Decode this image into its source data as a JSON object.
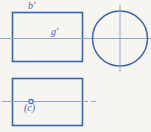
{
  "figure": {
    "kind": "orthographic-projection-drawing",
    "background_color": "#f7f5f1",
    "line_color": "#3a64a8",
    "centerline_color": "#8fa6c8",
    "labels": {
      "b_prime": "b'",
      "g_prime": "g'",
      "c_parenthesized": "(c)"
    },
    "views": {
      "front_view": {
        "shape": "rectangle",
        "x": 12,
        "y": 12,
        "width": 71,
        "height": 50
      },
      "side_view": {
        "shape": "circle",
        "center_x": 120,
        "center_y": 38,
        "radius": 28
      },
      "top_view": {
        "shape": "rectangle",
        "x": 12,
        "y": 78,
        "width": 71,
        "height": 48
      }
    },
    "centerlines": {
      "upper_horizontal_y": 38,
      "upper_horizontal_x1": 0,
      "upper_horizontal_x2": 151,
      "circle_vertical_x": 120,
      "circle_vertical_y1": 5,
      "circle_vertical_y2": 72,
      "lower_horizontal_y": 101,
      "lower_horizontal_x1": 2,
      "lower_horizontal_x2": 96
    },
    "point_marker": {
      "name": "point-c",
      "cx": 31,
      "cy": 101,
      "r": 2.1
    }
  }
}
